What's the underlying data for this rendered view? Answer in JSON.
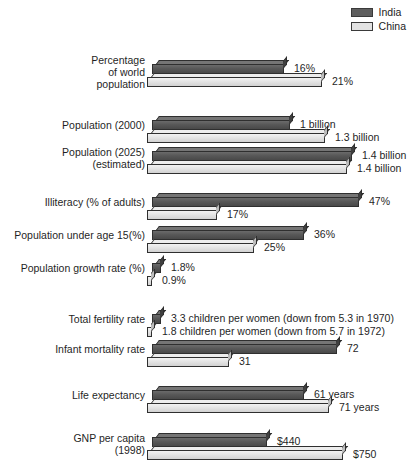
{
  "legend": {
    "items": [
      {
        "label": "India",
        "color": "#5e5e5e"
      },
      {
        "label": "China",
        "color": "#e2e2e2"
      }
    ]
  },
  "chart_data": {
    "type": "bar",
    "title": "",
    "subtitle": "",
    "xlabel": "",
    "ylabel": "",
    "orientation": "horizontal",
    "grid": false,
    "legend_position": "top-right",
    "legend_entries": [
      "India",
      "China"
    ],
    "series": [
      {
        "name": "India",
        "color": "#5e5e5e"
      },
      {
        "name": "China",
        "color": "#e2e2e2"
      }
    ],
    "categories": [
      "Percentage of world population",
      "Population (2000)",
      "Population (2025) (estimated)",
      "Illiteracy (% of adults)",
      "Population under age 15(%)",
      "Population growth rate (%)",
      "Total fertility rate",
      "Infant mortality rate",
      "Life expectancy",
      "GNP per capita (1998)"
    ],
    "rows": [
      {
        "label_lines": [
          "Percentage",
          "of world",
          "population"
        ],
        "india": {
          "value": 16,
          "display": "16%",
          "bar_px": 132
        },
        "china": {
          "value": 21,
          "display": "21%",
          "bar_px": 175
        }
      },
      {
        "label_lines": [
          "Population (2000)"
        ],
        "india": {
          "value": 1.0,
          "display": "1 billion",
          "bar_px": 138
        },
        "china": {
          "value": 1.3,
          "display": "1.3 billion",
          "bar_px": 178
        }
      },
      {
        "label_lines": [
          "Population (2025)",
          "(estimated)"
        ],
        "india": {
          "value": 1.4,
          "display": "1.4 billion",
          "bar_px": 200
        },
        "china": {
          "value": 1.4,
          "display": "1.4 billion",
          "bar_px": 200
        }
      },
      {
        "label_lines": [
          "Illiteracy (% of adults)"
        ],
        "india": {
          "value": 47,
          "display": "47%",
          "bar_px": 207
        },
        "china": {
          "value": 17,
          "display": "17%",
          "bar_px": 70
        }
      },
      {
        "label_lines": [
          "Population under age 15(%)"
        ],
        "india": {
          "value": 36,
          "display": "36%",
          "bar_px": 152
        },
        "china": {
          "value": 25,
          "display": "25%",
          "bar_px": 107
        }
      },
      {
        "label_lines": [
          "Population growth rate (%)"
        ],
        "india": {
          "value": 1.8,
          "display": "1.8%",
          "bar_px": 9
        },
        "china": {
          "value": 0.9,
          "display": "0.9%",
          "bar_px": 5
        }
      },
      {
        "label_lines": [
          "Total fertility rate"
        ],
        "india": {
          "value": 3.3,
          "display": "3.3 children per women (down from 5.3 in 1970)",
          "bar_px": 9
        },
        "china": {
          "value": 1.8,
          "display": "1.8 children per women (down from 5.7 in 1972)",
          "bar_px": 5
        }
      },
      {
        "label_lines": [
          "Infant mortality rate"
        ],
        "india": {
          "value": 72,
          "display": "72",
          "bar_px": 185
        },
        "china": {
          "value": 31,
          "display": "31",
          "bar_px": 82
        }
      },
      {
        "label_lines": [
          "Life expectancy"
        ],
        "india": {
          "value": 61,
          "display": "61 years",
          "bar_px": 152
        },
        "china": {
          "value": 71,
          "display": "71 years",
          "bar_px": 182
        }
      },
      {
        "label_lines": [
          "GNP per capita",
          "(1998)"
        ],
        "india": {
          "value": 440,
          "display": "$440",
          "bar_px": 115
        },
        "china": {
          "value": 750,
          "display": "$750",
          "bar_px": 196
        }
      }
    ]
  }
}
